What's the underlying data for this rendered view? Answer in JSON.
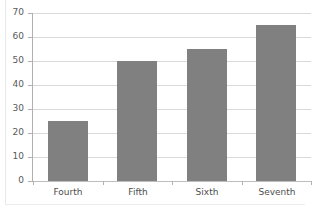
{
  "chart_data": {
    "type": "bar",
    "title": "",
    "title_remnant": "",
    "categories": [
      "Fourth",
      "Fifth",
      "Sixth",
      "Seventh"
    ],
    "values": [
      25,
      50,
      55,
      65
    ],
    "series": [
      {
        "name": "Series 1",
        "values": [
          25,
          50,
          55,
          65
        ]
      }
    ],
    "xlabel": "",
    "ylabel": "",
    "ylim": [
      0,
      70
    ],
    "ytick_step": 10,
    "yticks": [
      0,
      10,
      20,
      30,
      40,
      50,
      60,
      70
    ],
    "ytick_labels": [
      "0",
      "10",
      "20",
      "30",
      "40",
      "50",
      "60",
      "70"
    ],
    "grid": true,
    "grid_axis": "y",
    "legend": false,
    "legend_position": "none",
    "bar_color": "#808080",
    "gridline_color": "#d9d9d9",
    "axis_color": "#b0b0b0",
    "label_color": "#4d4d4d",
    "background": "#ffffff"
  }
}
